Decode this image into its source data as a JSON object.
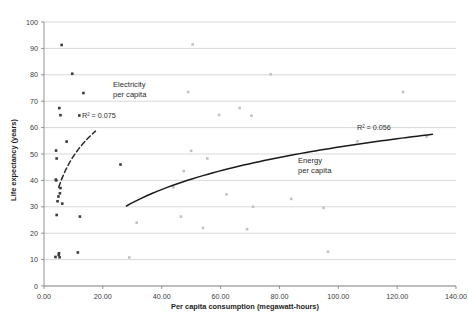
{
  "chart_data": {
    "type": "scatter",
    "title": "",
    "xlabel": "Per capita consumption (megawatt-hours)",
    "ylabel": "Life expectancy (years)",
    "xlim": [
      0,
      140
    ],
    "ylim": [
      0,
      100
    ],
    "xticks": [
      "0.00",
      "20.00",
      "40.00",
      "60.00",
      "80.00",
      "100.00",
      "120.00",
      "140.00"
    ],
    "xtick_values": [
      0,
      20,
      40,
      60,
      80,
      100,
      120,
      140
    ],
    "yticks": [
      "0",
      "10",
      "20",
      "30",
      "40",
      "50",
      "60",
      "70",
      "80",
      "90",
      "100"
    ],
    "ytick_values": [
      0,
      10,
      20,
      30,
      40,
      50,
      60,
      70,
      80,
      90,
      100
    ],
    "grid": "horizontal",
    "legend_position": "inline-annotations",
    "series": [
      {
        "name": "Electricity per capita",
        "marker": "square",
        "color": "#3b3b3b",
        "points": [
          [
            6.0,
            91.3
          ],
          [
            9.6,
            80.4
          ],
          [
            13.4,
            73.1
          ],
          [
            5.2,
            67.4
          ],
          [
            5.6,
            64.7
          ],
          [
            12.0,
            64.6
          ],
          [
            4.1,
            51.3
          ],
          [
            4.3,
            48.3
          ],
          [
            7.7,
            54.7
          ],
          [
            4.0,
            40.3
          ],
          [
            4.2,
            40.0
          ],
          [
            5.6,
            37.1
          ],
          [
            5.4,
            35.1
          ],
          [
            4.9,
            33.9
          ],
          [
            4.6,
            32.1
          ],
          [
            6.2,
            31.2
          ],
          [
            4.3,
            26.9
          ],
          [
            12.2,
            26.3
          ],
          [
            26.0,
            46.0
          ],
          [
            3.9,
            11.0
          ],
          [
            5.0,
            11.8
          ],
          [
            5.1,
            12.4
          ],
          [
            5.3,
            10.9
          ],
          [
            11.5,
            12.7
          ]
        ]
      },
      {
        "name": "Energy per capita",
        "marker": "square",
        "color": "#c2c2c2",
        "points": [
          [
            50.5,
            91.5
          ],
          [
            77.0,
            80.2
          ],
          [
            49.0,
            73.5
          ],
          [
            66.5,
            67.4
          ],
          [
            122.0,
            73.5
          ],
          [
            59.5,
            64.8
          ],
          [
            70.5,
            64.5
          ],
          [
            50.0,
            51.2
          ],
          [
            55.5,
            48.3
          ],
          [
            106.5,
            54.8
          ],
          [
            130.0,
            56.6
          ],
          [
            47.5,
            43.5
          ],
          [
            44.0,
            37.4
          ],
          [
            62.0,
            34.7
          ],
          [
            84.0,
            33.0
          ],
          [
            71.0,
            30.0
          ],
          [
            95.0,
            29.6
          ],
          [
            46.5,
            26.3
          ],
          [
            31.5,
            24.0
          ],
          [
            54.0,
            22.0
          ],
          [
            69.0,
            21.5
          ],
          [
            96.5,
            13.0
          ],
          [
            29.0,
            10.8
          ]
        ]
      }
    ],
    "trendlines": [
      {
        "name": "Electricity per capita trend",
        "style": "dashed",
        "r_squared_label": "R² = 0.075",
        "x_range": [
          5.0,
          17.5
        ]
      },
      {
        "name": "Energy per capita trend",
        "style": "solid",
        "r_squared_label": "R² = 0.056",
        "x_range": [
          28.0,
          132.0
        ]
      }
    ],
    "annotations": [
      {
        "id": "electricity-label",
        "text_line1": "Electricity",
        "text_line2": "per capita",
        "x": 113,
        "y": 87
      },
      {
        "id": "electricity-r2",
        "text": "R² = 0.075",
        "x": 82,
        "y": 118
      },
      {
        "id": "energy-label",
        "text_line1": "Energy",
        "text_line2": "per capita",
        "x": 298,
        "y": 163
      },
      {
        "id": "energy-r2",
        "text": "R² = 0.056",
        "x": 357,
        "y": 130
      }
    ]
  }
}
